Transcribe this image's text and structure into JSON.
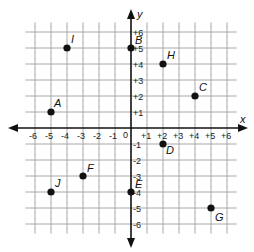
{
  "diagram": {
    "type": "coordinate-plane",
    "x_axis_label": "x",
    "y_axis_label": "y",
    "origin_label": "0",
    "x_range": [
      -6,
      6
    ],
    "y_range": [
      -6,
      6
    ],
    "x_ticks": [
      "-6",
      "-5",
      "-4",
      "-3",
      "-2",
      "-1",
      "+1",
      "+2",
      "+3",
      "+4",
      "+5",
      "+6"
    ],
    "y_ticks": [
      "+6",
      "+5",
      "+4",
      "+3",
      "+2",
      "+1",
      "-1",
      "-2",
      "-3",
      "-4",
      "-5",
      "-6"
    ],
    "points": [
      {
        "label": "A",
        "x": -5,
        "y": 1
      },
      {
        "label": "B",
        "x": 0,
        "y": 5
      },
      {
        "label": "C",
        "x": 4,
        "y": 2
      },
      {
        "label": "D",
        "x": 2,
        "y": -1
      },
      {
        "label": "E",
        "x": 0,
        "y": -4
      },
      {
        "label": "F",
        "x": -3,
        "y": -3
      },
      {
        "label": "G",
        "x": 5,
        "y": -5
      },
      {
        "label": "H",
        "x": 2,
        "y": 4
      },
      {
        "label": "I",
        "x": -4,
        "y": 5
      },
      {
        "label": "J",
        "x": -5,
        "y": -4
      }
    ],
    "colors": {
      "grid": "#a8a8a8",
      "axis": "#111111",
      "point": "#111111"
    }
  }
}
